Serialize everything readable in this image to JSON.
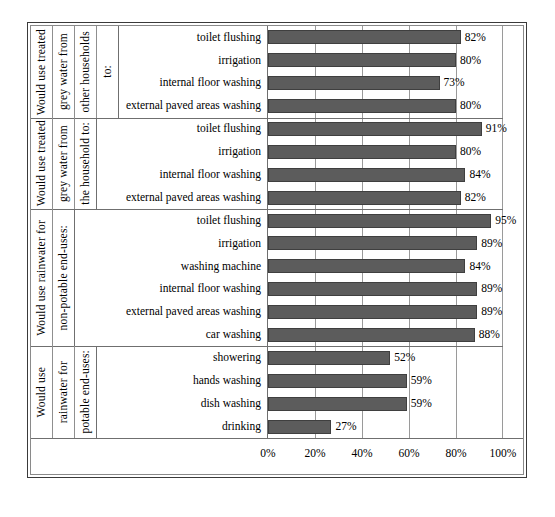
{
  "chart_data": {
    "type": "bar",
    "orientation": "horizontal",
    "title": "",
    "xlabel": "",
    "ylabel": "",
    "xlim": [
      0,
      100
    ],
    "xticks": [
      "0%",
      "20%",
      "40%",
      "60%",
      "80%",
      "100%"
    ],
    "xtick_values": [
      0,
      20,
      40,
      60,
      80,
      100
    ],
    "grid": "vertical",
    "legend": "none",
    "value_suffix": "%",
    "bar_color": "#5c5c5c",
    "bar_border_color": "#3f3f3f",
    "background": "#ffffff",
    "groups": [
      {
        "axis_title_lines": [
          "Would use treated",
          "grey water from",
          "other households",
          "to:"
        ],
        "categories": [
          "toilet flushing",
          "irrigation",
          "internal floor washing",
          "external paved areas washing"
        ],
        "values": [
          82,
          80,
          73,
          80
        ],
        "labels": [
          "82%",
          "80%",
          "73%",
          "80%"
        ]
      },
      {
        "axis_title_lines": [
          "Would use treated",
          "grey water from",
          "the household to:"
        ],
        "categories": [
          "toilet flushing",
          "irrigation",
          "internal floor washing",
          "external paved areas washing"
        ],
        "values": [
          91,
          80,
          84,
          82
        ],
        "labels": [
          "91%",
          "80%",
          "84%",
          "82%"
        ]
      },
      {
        "axis_title_lines": [
          "Would use rainwater for",
          "non-potable end-uses:"
        ],
        "categories": [
          "toilet flushing",
          "irrigation",
          "washing machine",
          "internal floor washing",
          "external paved areas washing",
          "car washing"
        ],
        "values": [
          95,
          89,
          84,
          89,
          89,
          88
        ],
        "labels": [
          "95%",
          "89%",
          "84%",
          "89%",
          "89%",
          "88%"
        ]
      },
      {
        "axis_title_lines": [
          "Would use",
          "rainwater for",
          "potable end-uses:"
        ],
        "categories": [
          "showering",
          "hands washing",
          "dish washing",
          "drinking"
        ],
        "values": [
          52,
          59,
          59,
          27
        ],
        "labels": [
          "52%",
          "59%",
          "59%",
          "27%"
        ]
      }
    ]
  }
}
